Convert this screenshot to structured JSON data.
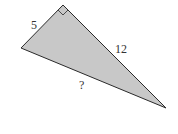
{
  "diagram": {
    "type": "right-triangle",
    "fill_color": "#c8c8c8",
    "stroke_color": "#2a2a2a",
    "vertices": {
      "right_angle": [
        63,
        5
      ],
      "left": [
        21,
        48
      ],
      "bottom_right": [
        166,
        108
      ]
    },
    "labels": {
      "short_leg": "5",
      "long_leg": "12",
      "hypotenuse": "?"
    }
  }
}
